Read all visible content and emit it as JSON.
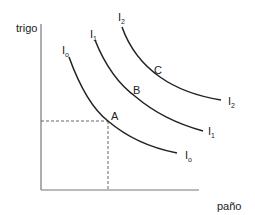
{
  "diagram": {
    "type": "indifference-curves",
    "axes": {
      "y_label": "trigo",
      "x_label": "paño"
    },
    "curves": [
      {
        "id": "I0",
        "label_main": "I",
        "label_sub": "o",
        "point_label": "A"
      },
      {
        "id": "I1",
        "label_main": "I",
        "label_sub": "1",
        "point_label": "B"
      },
      {
        "id": "I2",
        "label_main": "I",
        "label_sub": "2",
        "point_label": "C"
      }
    ],
    "reference_point": "A",
    "colors": {
      "axis": "#777777",
      "curve": "#222222",
      "dashed": "#555555",
      "text": "#222222"
    }
  }
}
